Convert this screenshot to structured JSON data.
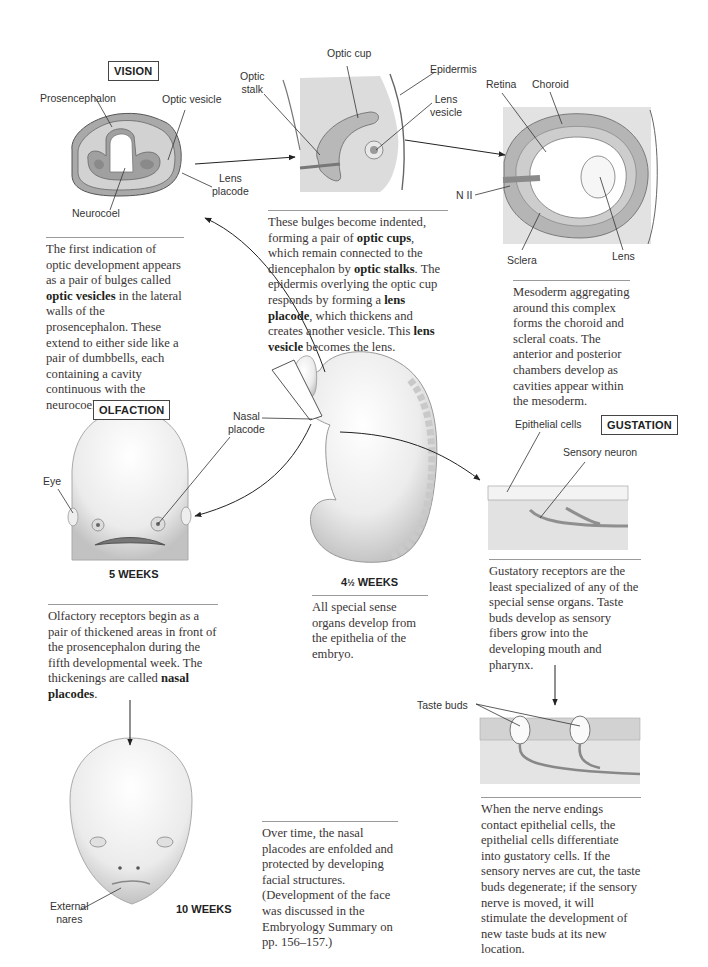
{
  "sections": {
    "vision": {
      "heading": "VISION",
      "stage1": {
        "labels": {
          "prosencephalon": "Prosencephalon",
          "optic_vesicle": "Optic vesicle",
          "lens_placode": [
            "Lens",
            "placode"
          ],
          "neurocoel": "Neurocoel"
        },
        "caption": [
          "The first indication of optic development appears as a pair of bulges called ",
          "optic vesicles",
          " in the lateral walls of the prosencephalon. These extend to either side like a pair of dumbbells, each containing a cavity continuous with the neurocoel."
        ]
      },
      "stage2": {
        "labels": {
          "optic_cup": "Optic cup",
          "optic_stalk": [
            "Optic",
            "stalk"
          ],
          "epidermis": "Epidermis",
          "lens_vesicle": [
            "Lens",
            "vesicle"
          ]
        },
        "caption": [
          "These bulges become indented, forming a pair of ",
          "optic cups",
          ", which remain connected to the diencephalon by ",
          "optic stalks",
          ". The epidermis overlying the optic cup responds by forming a ",
          "lens placode",
          ", which thickens and creates another vesicle. This ",
          "lens vesicle",
          " becomes the lens."
        ]
      },
      "stage3": {
        "labels": {
          "retina": "Retina",
          "choroid": "Choroid",
          "n_ii": "N II",
          "sclera": "Sclera",
          "lens": "Lens"
        },
        "caption": "Mesoderm aggregating around this complex forms the choroid and scleral coats. The anterior and posterior chambers develop as cavities appear within the mesoderm."
      }
    },
    "embryo": {
      "age": "4½ WEEKS",
      "age_main": "4",
      "age_frac": "½",
      "age_unit": " WEEKS",
      "label_nasal_placode": [
        "Nasal",
        "placode"
      ],
      "caption": "All special sense organs develop from the epithelia of the embryo."
    },
    "olfaction": {
      "heading": "OLFACTION",
      "stage1": {
        "age": "5 WEEKS",
        "labels": {
          "eye": "Eye"
        },
        "caption": [
          "Olfactory receptors begin as a pair of thickened areas in front of the prosencephalon during the fifth developmental week. The thickenings are called ",
          "nasal placodes",
          "."
        ]
      },
      "stage2": {
        "age": "10 WEEKS",
        "labels": {
          "external_nares": [
            "External",
            "nares"
          ]
        },
        "caption": "Over time, the nasal placodes are enfolded and protected by developing facial structures. (Development of the face was discussed in the Embryology Summary on pp. 156–157.)"
      }
    },
    "gustation": {
      "heading": "GUSTATION",
      "stage1": {
        "labels": {
          "epithelial_cells": "Epithelial cells",
          "sensory_neuron": "Sensory neuron"
        },
        "caption": "Gustatory receptors are the least specialized of any of the special sense organs. Taste buds develop as sensory fibers grow into the developing mouth and pharynx."
      },
      "stage2": {
        "labels": {
          "taste_buds": "Taste buds"
        },
        "caption": "When the nerve endings contact epithelial cells, the epithelial cells differentiate into gustatory cells. If the sensory nerves are cut, the taste buds degenerate; if the sensory nerve is moved, it will stimulate the development of new taste buds at its new location."
      }
    }
  },
  "colors": {
    "tissue_dark": "#9c9c9c",
    "tissue_mid": "#c4c4c4",
    "tissue_light": "#e3e3e3",
    "panel_bg": "#e6e6e6",
    "line": "#333333"
  }
}
